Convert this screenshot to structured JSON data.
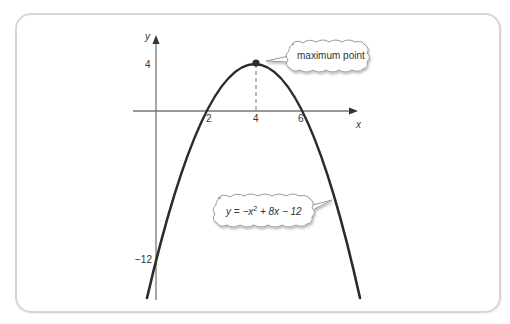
{
  "diagram": {
    "type": "parabola-graph",
    "equation": {
      "prefix": "y = −x",
      "exponent": "2",
      "suffix": " + 8x − 12"
    },
    "axes": {
      "x_label": "x",
      "y_label": "y",
      "x_ticks": [
        "2",
        "4",
        "6"
      ],
      "y_ticks": [
        "4",
        "−12"
      ]
    },
    "callouts": {
      "vertex": "maximum point"
    },
    "vertex": {
      "x": 4,
      "y": 4
    },
    "roots": [
      2,
      6
    ],
    "y_intercept": -12,
    "colors": {
      "curve": "#2b2b2b",
      "axis": "#777777",
      "frame": "#d6d6d6",
      "bubble_fill": "#ffffff",
      "bubble_stroke": "#9a9a9a"
    }
  }
}
